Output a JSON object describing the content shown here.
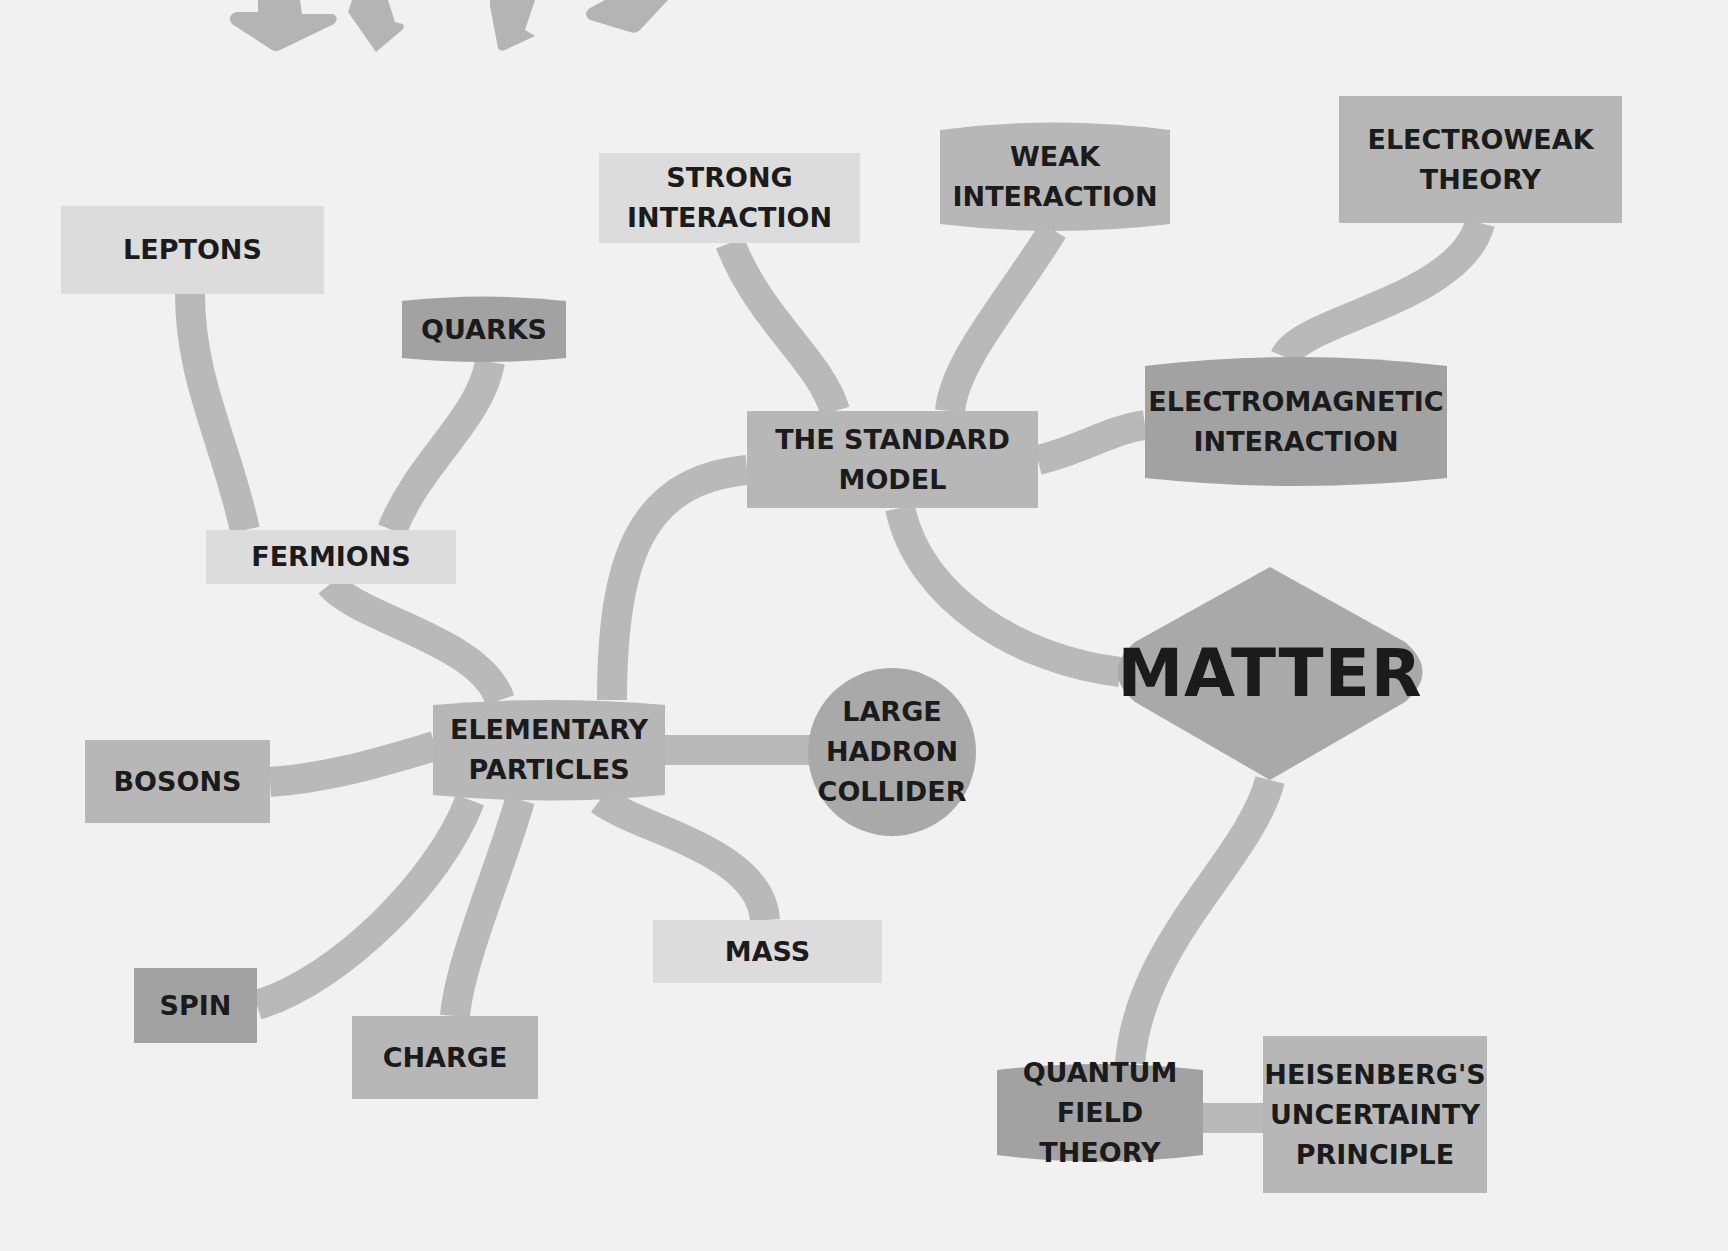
{
  "colors": {
    "background": "#f1f1f1",
    "connector": "#b9b9b9",
    "light": "#dcdcdc",
    "medium": "#b7b7b7",
    "dark": "#a2a2a2",
    "text": "#1b1b1b"
  },
  "title": "MATTER",
  "nodes": {
    "matter": "MATTER",
    "standard_model": "THE STANDARD\nMODEL",
    "strong_interaction": "STRONG\nINTERACTION",
    "weak_interaction": "WEAK\nINTERACTION",
    "electroweak_theory": "ELECTROWEAK\nTHEORY",
    "electromagnetic_interaction": "ELECTROMAGNETIC\nINTERACTION",
    "leptons": "LEPTONS",
    "quarks": "QUARKS",
    "fermions": "FERMIONS",
    "elementary_particles": "ELEMENTARY\nPARTICLES",
    "large_hadron_collider": "LARGE\nHADRON\nCOLLIDER",
    "bosons": "BOSONS",
    "spin": "SPIN",
    "charge": "CHARGE",
    "mass": "MASS",
    "quantum_field_theory": "QUANTUM FIELD\nTHEORY",
    "heisenberg": "HEISENBERG'S\nUNCERTAINTY\nPRINCIPLE"
  },
  "decorations": {
    "arrows": [
      "arrow-down",
      "arrow-down",
      "arrow-down",
      "arrow-down"
    ]
  }
}
